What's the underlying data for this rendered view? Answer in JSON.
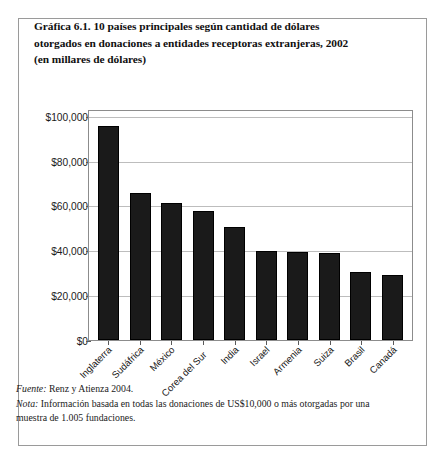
{
  "title": {
    "line1": "Gráfica 6.1.  10 países principales según cantidad de dólares",
    "line2": "otorgados en donaciones a  entidades receptoras extranjeras, 2002",
    "line3": "(en millares de dólares)"
  },
  "notes": {
    "source_label": "Fuente:",
    "source_text": "Renz y Atienza 2004.",
    "note_label": "Nota:",
    "note_text": "Información basada en todas las donaciones de US$10,000 o más otorgadas por una muestra de 1.005 fundaciones."
  },
  "chart_data": {
    "type": "bar",
    "title": "Gráfica 6.1.  10 países principales según cantidad de dólares otorgados en donaciones a  entidades receptoras extranjeras, 2002 (en millares de dólares)",
    "xlabel": "",
    "ylabel": "",
    "ylim": [
      0,
      100000
    ],
    "ytick_values": [
      0,
      20000,
      40000,
      60000,
      80000,
      100000
    ],
    "ytick_labels": [
      "$0",
      "$20,000",
      "$40,000",
      "$60,000",
      "$80,000",
      "$100,000"
    ],
    "grid": true,
    "legend": false,
    "bar_color": "#1a1a1a",
    "categories": [
      "Inglaterra",
      "Sudáfrica",
      "México",
      "Corea del Sur",
      "India",
      "Israel",
      "Armenia",
      "Suiza",
      "Brasil",
      "Canadá"
    ],
    "values": [
      95500,
      65500,
      61000,
      57500,
      50500,
      39800,
      39200,
      38800,
      30200,
      29000
    ]
  }
}
